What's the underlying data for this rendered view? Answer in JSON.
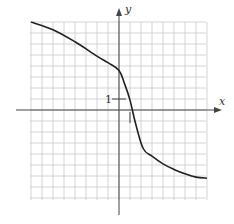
{
  "chart_data": {
    "type": "line",
    "title": "",
    "xlabel": "x",
    "ylabel": "y",
    "tick_labels": {
      "y_unit": "1"
    },
    "grid": true,
    "xlim": [
      -8,
      8
    ],
    "ylim": [
      -8,
      8
    ],
    "series": [
      {
        "name": "curve",
        "x": [
          -8,
          -6,
          -4,
          -2,
          -1,
          0,
          0.5,
          1,
          1.5,
          2.2,
          3,
          4,
          5,
          6,
          7,
          8
        ],
        "y": [
          8,
          7.3,
          6.2,
          4.9,
          4.3,
          3.6,
          2.4,
          0.9,
          -1.2,
          -3.5,
          -4.2,
          -4.9,
          -5.4,
          -5.8,
          -6.1,
          -6.2
        ]
      }
    ],
    "annotations": [
      "tick at y=1 labeled '1'",
      "tick at x=1 below the x-axis"
    ]
  },
  "labels": {
    "x_axis": "x",
    "y_axis": "y",
    "unit": "1"
  }
}
